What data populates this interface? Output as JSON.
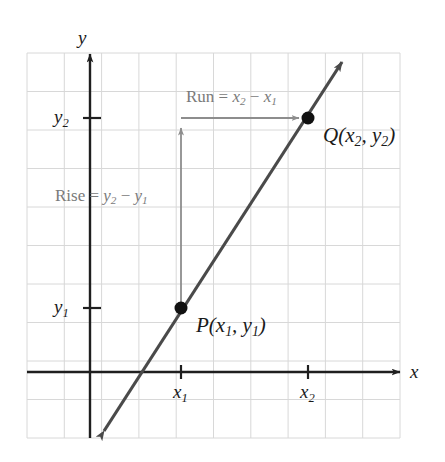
{
  "figure": {
    "kind": "coordinate-plane-slope-diagram",
    "title_visible": false,
    "background_color": "#ffffff",
    "grid_color": "#d8d8d8",
    "axis_color": "#1f1f1f",
    "line_color": "#4a4a4a",
    "annotation_color": "#7a7a7a",
    "point_color": "#111111"
  },
  "axes": {
    "x_axis_label": "x",
    "y_axis_label": "y",
    "x_axis_label_position": {
      "x": 415,
      "y": 372
    },
    "y_axis_label_position": {
      "x": 83,
      "y": 38
    },
    "origin_px": {
      "x": 90,
      "y": 372
    },
    "grid": {
      "left": 27,
      "top": 53,
      "right": 400,
      "bottom": 438,
      "cell_width": 37.3,
      "cell_height": 38.5,
      "columns": 10,
      "rows": 10,
      "visible": true
    }
  },
  "ticks": {
    "x": [
      {
        "label": "x",
        "sub": "1",
        "x": 181,
        "y": 372,
        "label_x": 181,
        "label_y": 392
      },
      {
        "label": "x",
        "sub": "2",
        "x": 308,
        "y": 372,
        "label_x": 308,
        "label_y": 392
      }
    ],
    "y": [
      {
        "label": "y",
        "sub": "2",
        "x": 90,
        "y": 118,
        "label_x": 68,
        "label_y": 118
      },
      {
        "label": "y",
        "sub": "1",
        "x": 90,
        "y": 308,
        "label_x": 68,
        "label_y": 308
      }
    ]
  },
  "line": {
    "description": "straight line through P and Q with arrowheads at both ends",
    "start": {
      "x": 100,
      "y": 437
    },
    "end": {
      "x": 347,
      "y": 54
    },
    "stroke_width": 3.2,
    "arrowheads": "both"
  },
  "points": [
    {
      "name": "P",
      "label": "P(x",
      "sub1": "1",
      "mid": ", y",
      "sub2": "1",
      "close": ")",
      "px": {
        "x": 181,
        "y": 308
      },
      "label_px": {
        "x": 196,
        "y": 326
      },
      "radius": 6.5
    },
    {
      "name": "Q",
      "label": "Q(x",
      "sub1": "2",
      "mid": ", y",
      "sub2": "2",
      "close": ")",
      "px": {
        "x": 308,
        "y": 118
      },
      "label_px": {
        "x": 323,
        "y": 136
      },
      "radius": 6.5
    }
  ],
  "annotations": {
    "run": {
      "prefix": "Run = ",
      "var1": "x",
      "sub1": "2",
      "operator": " − ",
      "var2": "x",
      "sub2": "1",
      "text_position": {
        "x": 186,
        "y": 99
      },
      "arrow": {
        "x1": 181,
        "y1": 118,
        "x2": 303,
        "y2": 118,
        "direction": "right"
      }
    },
    "rise": {
      "prefix": "Rise = ",
      "var1": "y",
      "sub1": "2",
      "operator": " − ",
      "var2": "y",
      "sub2": "1",
      "text_position": {
        "x": 55,
        "y": 197
      },
      "arrow": {
        "x1": 181,
        "y1": 308,
        "x2": 181,
        "y2": 124,
        "direction": "up"
      }
    }
  }
}
